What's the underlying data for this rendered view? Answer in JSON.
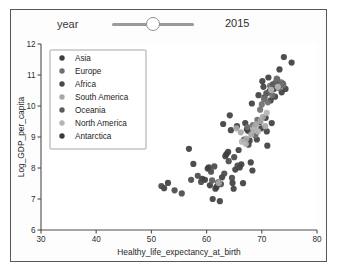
{
  "top_scrap_text": "     ",
  "widget": {
    "name": "interactive-scatter-widget"
  },
  "slider": {
    "label": "year",
    "value": "2015",
    "handle_fraction": 0.5
  },
  "chart_data": {
    "type": "scatter",
    "title": "",
    "xlabel": "Healthy_life_expectancy_at_birth",
    "ylabel": "Log_GDP_per_capita",
    "xlim": [
      30,
      80
    ],
    "ylim": [
      6,
      12
    ],
    "xticks": [
      30,
      40,
      50,
      60,
      70,
      80
    ],
    "yticks": [
      6,
      7,
      8,
      9,
      10,
      11,
      12
    ],
    "grid": false,
    "legend_position": "upper left",
    "marker_size": 3.1,
    "legend": [
      {
        "label": "Asia",
        "color": "#3f3f3f"
      },
      {
        "label": "Europe",
        "color": "#6f6f6f"
      },
      {
        "label": "Africa",
        "color": "#4a4a4a"
      },
      {
        "label": "South America",
        "color": "#a8a8a8"
      },
      {
        "label": "Oceania",
        "color": "#5b5b5b"
      },
      {
        "label": "North America",
        "color": "#b5b5b5"
      },
      {
        "label": "Antarctica",
        "color": "#3a3a3a"
      }
    ],
    "series": [
      {
        "name": "Asia",
        "color": "#3f3f3f",
        "points": [
          [
            52.3,
            7.35
          ],
          [
            53.0,
            7.52
          ],
          [
            56.8,
            8.62
          ],
          [
            57.6,
            8.13
          ],
          [
            59.2,
            7.65
          ],
          [
            59.7,
            7.62
          ],
          [
            60.2,
            7.98
          ],
          [
            60.4,
            8.02
          ],
          [
            60.6,
            7.44
          ],
          [
            61.1,
            7.0
          ],
          [
            61.6,
            7.33
          ],
          [
            61.8,
            7.39
          ],
          [
            62.1,
            7.54
          ],
          [
            62.4,
            6.93
          ],
          [
            62.8,
            7.7
          ],
          [
            63.0,
            9.42
          ],
          [
            63.4,
            8.38
          ],
          [
            63.6,
            8.45
          ],
          [
            63.9,
            8.52
          ],
          [
            64.2,
            9.7
          ],
          [
            64.4,
            9.22
          ],
          [
            64.7,
            7.52
          ],
          [
            64.9,
            7.33
          ],
          [
            65.2,
            7.95
          ],
          [
            65.5,
            9.35
          ],
          [
            65.8,
            8.58
          ],
          [
            66.0,
            8.02
          ],
          [
            66.3,
            8.12
          ],
          [
            66.6,
            7.51
          ],
          [
            67.0,
            9.45
          ],
          [
            67.3,
            9.25
          ],
          [
            67.5,
            9.2
          ],
          [
            67.8,
            8.88
          ],
          [
            68.0,
            8.18
          ],
          [
            68.2,
            10.08
          ],
          [
            68.3,
            7.92
          ],
          [
            68.6,
            9.22
          ],
          [
            68.9,
            9.12
          ],
          [
            69.1,
            8.92
          ],
          [
            69.4,
            10.35
          ],
          [
            69.6,
            9.48
          ],
          [
            69.9,
            9.28
          ],
          [
            70.1,
            10.8
          ],
          [
            70.3,
            10.62
          ],
          [
            70.5,
            10.28
          ],
          [
            70.7,
            9.62
          ],
          [
            70.9,
            9.18
          ],
          [
            71.0,
            8.72
          ],
          [
            71.2,
            10.92
          ],
          [
            71.4,
            10.48
          ],
          [
            71.6,
            10.18
          ],
          [
            71.8,
            9.45
          ],
          [
            72.0,
            10.7
          ],
          [
            72.2,
            10.55
          ],
          [
            72.4,
            10.3
          ],
          [
            72.6,
            10.78
          ],
          [
            72.8,
            10.85
          ],
          [
            73.0,
            10.62
          ],
          [
            73.2,
            11.18
          ],
          [
            73.4,
            10.7
          ],
          [
            73.6,
            10.44
          ],
          [
            73.8,
            10.72
          ],
          [
            74.0,
            11.58
          ],
          [
            74.3,
            10.55
          ],
          [
            75.4,
            11.4
          ]
        ]
      },
      {
        "name": "Europe",
        "color": "#6f6f6f",
        "points": [
          [
            67.4,
            9.32
          ],
          [
            68.4,
            9.38
          ],
          [
            68.8,
            9.05
          ],
          [
            69.2,
            9.55
          ],
          [
            69.7,
            9.88
          ],
          [
            70.0,
            10.05
          ],
          [
            70.4,
            10.22
          ],
          [
            70.8,
            10.4
          ],
          [
            71.1,
            10.12
          ],
          [
            71.5,
            10.65
          ],
          [
            71.9,
            10.35
          ],
          [
            72.3,
            10.72
          ],
          [
            72.7,
            10.88
          ],
          [
            73.1,
            10.58
          ],
          [
            73.5,
            10.76
          ],
          [
            73.9,
            10.68
          ]
        ]
      },
      {
        "name": "Africa",
        "color": "#4a4a4a",
        "points": [
          [
            51.8,
            7.42
          ],
          [
            54.2,
            7.28
          ],
          [
            55.5,
            7.18
          ],
          [
            57.2,
            7.62
          ],
          [
            58.4,
            7.75
          ],
          [
            59.0,
            7.55
          ],
          [
            60.8,
            7.88
          ],
          [
            61.4,
            8.05
          ],
          [
            62.6,
            7.48
          ],
          [
            63.2,
            7.82
          ],
          [
            64.0,
            8.22
          ],
          [
            64.6,
            7.68
          ],
          [
            65.0,
            8.35
          ],
          [
            65.6,
            8.08
          ],
          [
            66.8,
            8.92
          ],
          [
            67.6,
            8.75
          ]
        ]
      },
      {
        "name": "South America",
        "color": "#a8a8a8",
        "points": [
          [
            62.2,
            7.52
          ],
          [
            65.4,
            9.28
          ],
          [
            66.2,
            9.15
          ],
          [
            67.2,
            8.95
          ],
          [
            68.1,
            9.08
          ],
          [
            68.7,
            9.32
          ],
          [
            69.0,
            9.42
          ],
          [
            69.8,
            9.52
          ],
          [
            70.2,
            9.65
          ],
          [
            70.6,
            9.35
          ]
        ]
      },
      {
        "name": "Oceania",
        "color": "#5b5b5b",
        "points": [
          [
            61.0,
            7.6
          ],
          [
            70.9,
            10.42
          ],
          [
            72.1,
            10.68
          ]
        ]
      },
      {
        "name": "North America",
        "color": "#b5b5b5",
        "points": [
          [
            66.4,
            8.85
          ],
          [
            67.1,
            8.78
          ],
          [
            68.5,
            9.22
          ],
          [
            69.3,
            9.18
          ],
          [
            70.9,
            9.78
          ],
          [
            71.7,
            10.52
          ],
          [
            72.9,
            10.62
          ]
        ]
      },
      {
        "name": "Antarctica",
        "color": "#3a3a3a",
        "points": []
      }
    ]
  }
}
